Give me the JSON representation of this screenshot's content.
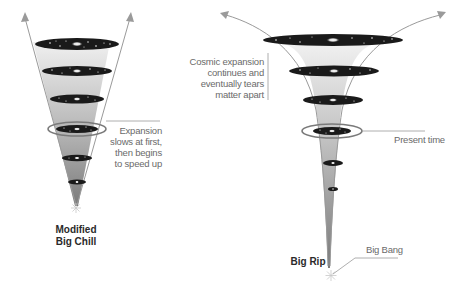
{
  "diagram": {
    "models": [
      {
        "id": "modified-big-chill",
        "title_line1": "Modified",
        "title_line2": "Big Chill",
        "annotation": [
          "Expansion",
          "slows at first,",
          "then begins",
          "to speed up"
        ]
      },
      {
        "id": "big-rip",
        "title": "Big Rip",
        "annotation": [
          "Cosmic expansion",
          "continues and",
          "eventually tears",
          "matter apart"
        ],
        "present_label": "Present time",
        "origin_label": "Big Bang"
      }
    ],
    "colors": {
      "cone_light": "#e8e8e8",
      "cone_dark": "#8a8a8a",
      "galaxy_disk": "#1a1a1a",
      "ring": "#7a7a7a",
      "arrow": "#9a9a9a",
      "label_text": "#6a6a6a",
      "title_text": "#2a2a2a"
    }
  }
}
